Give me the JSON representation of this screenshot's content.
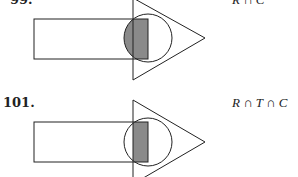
{
  "problems": [
    {
      "number": "99.",
      "expression": "R ∩ C"
    },
    {
      "number": "101.",
      "expression": "R ∩ T ∩ C"
    }
  ],
  "colors": {
    "shade": "#8a8a8a",
    "stroke": "#222222"
  }
}
